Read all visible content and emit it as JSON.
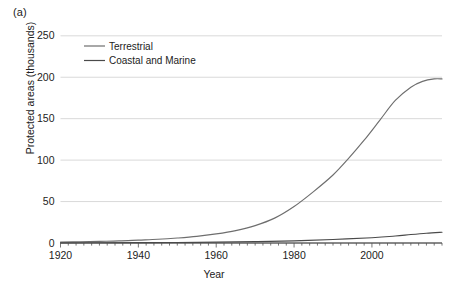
{
  "panel": {
    "label": "(a)"
  },
  "chart_data": {
    "type": "line",
    "title": "",
    "panel_label": "(a)",
    "xlabel": "Year",
    "ylabel": "Protected areas (thousands)",
    "xlim": [
      1920,
      2018
    ],
    "ylim": [
      0,
      250
    ],
    "xticks": [
      1920,
      1940,
      1960,
      1980,
      2000
    ],
    "yticks": [
      0,
      50,
      100,
      150,
      200,
      250
    ],
    "grid": "horizontal",
    "legend_position": "top-left-inside",
    "minor_ticks": "x-axis, every 2 years",
    "series": [
      {
        "name": "Terrestrial",
        "color": "#6e6e6e",
        "x": [
          1920,
          1925,
          1930,
          1935,
          1940,
          1945,
          1950,
          1955,
          1960,
          1965,
          1970,
          1975,
          1980,
          1985,
          1990,
          1994,
          1998,
          2002,
          2006,
          2010,
          2013,
          2016,
          2018
        ],
        "values": [
          1,
          1.5,
          2,
          2.5,
          3.5,
          4.5,
          6,
          8,
          11,
          15,
          21,
          30,
          44,
          62,
          82,
          102,
          124,
          148,
          172,
          188,
          195,
          198,
          198
        ]
      },
      {
        "name": "Coastal and Marine",
        "color": "#4a4a4a",
        "x": [
          1920,
          1930,
          1940,
          1950,
          1960,
          1970,
          1980,
          1990,
          2000,
          2006,
          2010,
          2014,
          2018
        ],
        "values": [
          0.2,
          0.3,
          0.4,
          0.6,
          1.0,
          1.6,
          2.6,
          4.2,
          6.4,
          8.4,
          10.2,
          11.8,
          13.0
        ]
      }
    ]
  },
  "legend": {
    "items": [
      {
        "label": "Terrestrial"
      },
      {
        "label": "Coastal and Marine"
      }
    ]
  },
  "axes": {
    "x_tick_labels": [
      "1920",
      "1940",
      "1960",
      "1980",
      "2000"
    ],
    "y_tick_labels": [
      "0",
      "50",
      "100",
      "150",
      "200",
      "250"
    ],
    "x_title": "Year",
    "y_title": "Protected areas (thousands)"
  }
}
